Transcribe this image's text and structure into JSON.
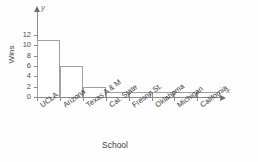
{
  "chart_data": {
    "type": "bar",
    "title": "",
    "subtitle": "",
    "xlabel": "School",
    "ylabel": "Wins",
    "x_axis_variable": "x",
    "y_axis_variable": "y",
    "categories": [
      "UCLA",
      "Arizona",
      "Texas A & M",
      "Cal. State",
      "Fresno St.",
      "Oklahoma",
      "Michigan",
      "California"
    ],
    "values": [
      11,
      6,
      2,
      1,
      1,
      1,
      1,
      1
    ],
    "ylim": [
      0,
      12
    ],
    "ytick_labels": [
      "0",
      "2",
      "4",
      "6",
      "8",
      "10",
      "12"
    ],
    "ytick_values": [
      0,
      2,
      4,
      6,
      8,
      10,
      12
    ],
    "grid": false,
    "legend": null,
    "legend_position": "none",
    "bar_fill_color": "#ffffff",
    "bar_edge_color": "#a0a0a0",
    "axis_color": "#8a8a8a",
    "text_color": "#3c3c3c",
    "background_color": "#fefefe"
  }
}
